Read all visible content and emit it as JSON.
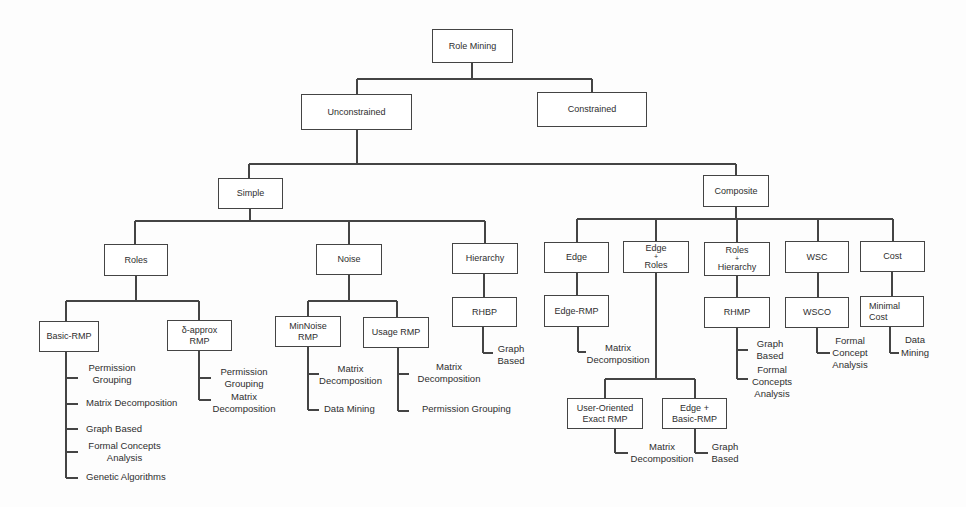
{
  "diagram": {
    "root": {
      "label": "Role Mining"
    },
    "unconstrained": {
      "label": "Unconstrained"
    },
    "constrained": {
      "label": "Constrained"
    },
    "simple": {
      "label": "Simple"
    },
    "composite": {
      "label": "Composite"
    },
    "roles": {
      "label": "Roles"
    },
    "noise": {
      "label": "Noise"
    },
    "hierarchy": {
      "label": "Hierarchy"
    },
    "edge": {
      "label": "Edge"
    },
    "edge_roles": {
      "label_lines": [
        "Edge",
        "+",
        "Roles"
      ]
    },
    "roles_hierarchy": {
      "label_lines": [
        "Roles",
        "+",
        "Hierarchy"
      ]
    },
    "wsc": {
      "label": "WSC"
    },
    "cost": {
      "label": "Cost"
    },
    "basic_rmp": {
      "label": "Basic-RMP",
      "methods": [
        [
          "Permission",
          "Grouping"
        ],
        [
          "Matrix Decomposition"
        ],
        [
          "Graph Based"
        ],
        [
          "Formal Concepts",
          "Analysis"
        ],
        [
          "Genetic Algorithms"
        ]
      ]
    },
    "delta_approx_rmp": {
      "label_lines": [
        "δ-approx",
        "RMP"
      ],
      "methods": [
        [
          "Permission",
          "Grouping"
        ],
        [
          "Matrix",
          "Decomposition"
        ]
      ]
    },
    "minnoise_rmp": {
      "label_lines": [
        "MinNoise",
        "RMP"
      ],
      "methods": [
        [
          "Matrix",
          "Decomposition"
        ],
        [
          "Data Mining"
        ]
      ]
    },
    "usage_rmp": {
      "label": "Usage RMP",
      "methods": [
        [
          "Matrix",
          "Decomposition"
        ],
        [
          "Permission Grouping"
        ]
      ]
    },
    "rhbp": {
      "label": "RHBP",
      "methods": [
        [
          "Graph",
          "Based"
        ]
      ]
    },
    "edge_rmp": {
      "label": "Edge-RMP",
      "methods": [
        [
          "Matrix",
          "Decomposition"
        ]
      ]
    },
    "user_oriented_exact_rmp": {
      "label_lines": [
        "User-Oriented",
        "Exact RMP"
      ],
      "methods": [
        [
          "Matrix",
          "Decomposition"
        ]
      ]
    },
    "edge_basic_rmp": {
      "label_lines": [
        "Edge +",
        "Basic-RMP"
      ],
      "methods": [
        [
          "Graph",
          "Based"
        ]
      ]
    },
    "rhmp": {
      "label": "RHMP",
      "methods": [
        [
          "Graph",
          "Based"
        ],
        [
          "Formal",
          "Concepts",
          "Analysis"
        ]
      ]
    },
    "wsco": {
      "label": "WSCO",
      "methods": [
        [
          "Formal",
          "Concept",
          "Analysis"
        ]
      ]
    },
    "minimal_cost": {
      "label_lines": [
        "Minimal",
        "Cost"
      ],
      "methods": [
        [
          "Data",
          "Mining"
        ]
      ]
    }
  },
  "colors": {
    "line": "#444444",
    "text": "#2e2e2e",
    "background": "#fdfdfd"
  }
}
